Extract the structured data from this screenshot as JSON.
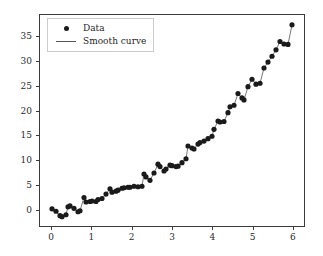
{
  "chart_data": {
    "type": "scatter",
    "title": "",
    "xlabel": "",
    "ylabel": "",
    "xlim": [
      -0.3,
      6.3
    ],
    "ylim": [
      -3.5,
      39.5
    ],
    "grid": false,
    "legend_position": "upper left",
    "xticks": [
      0,
      1,
      2,
      3,
      4,
      5,
      6
    ],
    "yticks": [
      0,
      5,
      10,
      15,
      20,
      25,
      30,
      35
    ],
    "series": [
      {
        "name": "Data",
        "marker": "circle",
        "color": "#1a1a1a",
        "x": [
          0.0,
          0.1,
          0.2,
          0.25,
          0.35,
          0.4,
          0.45,
          0.55,
          0.65,
          0.7,
          0.8,
          0.85,
          0.95,
          1.0,
          1.1,
          1.15,
          1.25,
          1.35,
          1.45,
          1.5,
          1.6,
          1.65,
          1.75,
          1.8,
          1.9,
          1.95,
          2.05,
          2.15,
          2.25,
          2.3,
          2.35,
          2.45,
          2.55,
          2.65,
          2.7,
          2.8,
          2.85,
          2.95,
          3.0,
          3.1,
          3.15,
          3.25,
          3.35,
          3.4,
          3.5,
          3.55,
          3.65,
          3.7,
          3.8,
          3.9,
          4.0,
          4.05,
          4.15,
          4.2,
          4.3,
          4.4,
          4.45,
          4.55,
          4.65,
          4.75,
          4.8,
          4.9,
          5.0,
          5.1,
          5.2,
          5.3,
          5.4,
          5.5,
          5.6,
          5.7,
          5.8,
          5.9,
          6.0
        ],
        "y": [
          0.0,
          -0.5,
          -1.4,
          -1.6,
          -1.2,
          0.4,
          0.6,
          0.1,
          -0.6,
          -0.4,
          2.3,
          1.4,
          1.5,
          1.6,
          1.5,
          1.9,
          2.1,
          3.0,
          4.1,
          3.4,
          3.6,
          3.8,
          4.2,
          4.3,
          4.4,
          4.4,
          4.6,
          4.5,
          4.6,
          7.1,
          6.5,
          5.8,
          7.3,
          9.1,
          8.6,
          7.7,
          8.1,
          8.9,
          8.8,
          8.6,
          8.7,
          9.4,
          10.2,
          12.8,
          12.4,
          12.2,
          13.2,
          13.5,
          13.8,
          14.3,
          14.8,
          16.2,
          17.9,
          17.7,
          17.8,
          19.6,
          20.8,
          21.1,
          23.5,
          22.6,
          22.2,
          24.9,
          26.4,
          25.4,
          25.6,
          28.7,
          29.9,
          31.1,
          32.4,
          34.1,
          33.6,
          33.5,
          37.5
        ]
      }
    ],
    "smooth_curve": {
      "name": "Smooth curve",
      "color": "#555555",
      "style": "solid"
    },
    "legend_entries": [
      {
        "label": "Data",
        "key": "dot-marker"
      },
      {
        "label": "Smooth curve",
        "key": "line-marker"
      }
    ]
  },
  "axes": {
    "frame_color": "#3b3b3b",
    "background": "#ffffff"
  }
}
